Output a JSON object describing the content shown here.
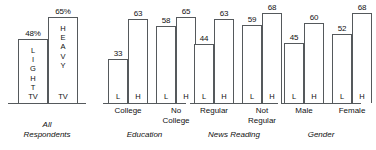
{
  "chart_data": {
    "type": "bar",
    "title": "",
    "xlabel": "",
    "ylabel": "",
    "ylim": [
      0,
      75
    ],
    "grid": false,
    "legend": "none",
    "series_names": [
      "Light TV",
      "Heavy TV"
    ],
    "panels": [
      {
        "title": "All\nRespondents",
        "groups": [
          {
            "label": "",
            "bars": [
              {
                "key": "L",
                "value": 48,
                "value_label": "48%",
                "stacked_letters": "L\nI\nG\nH\nT",
                "footer": "TV"
              },
              {
                "key": "H",
                "value": 65,
                "value_label": "65%",
                "stacked_letters": "H\nE\nA\nV\nY",
                "footer": "TV"
              }
            ]
          }
        ]
      },
      {
        "title": "Education",
        "groups": [
          {
            "label": "College",
            "bars": [
              {
                "key": "L",
                "value": 33,
                "value_label": "33",
                "inner": "L"
              },
              {
                "key": "H",
                "value": 63,
                "value_label": "63",
                "inner": "H"
              }
            ]
          },
          {
            "label": "No\nCollege",
            "bars": [
              {
                "key": "L",
                "value": 58,
                "value_label": "58",
                "inner": "L"
              },
              {
                "key": "H",
                "value": 65,
                "value_label": "65",
                "inner": "H"
              }
            ]
          }
        ]
      },
      {
        "title": "News Reading",
        "groups": [
          {
            "label": "Regular",
            "bars": [
              {
                "key": "L",
                "value": 44,
                "value_label": "44",
                "inner": "L"
              },
              {
                "key": "H",
                "value": 63,
                "value_label": "63",
                "inner": "H"
              }
            ]
          },
          {
            "label": "Not\nRegular",
            "bars": [
              {
                "key": "L",
                "value": 59,
                "value_label": "59",
                "inner": "L"
              },
              {
                "key": "H",
                "value": 68,
                "value_label": "68",
                "inner": "H"
              }
            ]
          }
        ]
      },
      {
        "title": "Gender",
        "groups": [
          {
            "label": "Male",
            "bars": [
              {
                "key": "L",
                "value": 45,
                "value_label": "45",
                "inner": "L"
              },
              {
                "key": "H",
                "value": 60,
                "value_label": "60",
                "inner": "H"
              }
            ]
          },
          {
            "label": "Female",
            "bars": [
              {
                "key": "L",
                "value": 52,
                "value_label": "52",
                "inner": "L"
              },
              {
                "key": "H",
                "value": 68,
                "value_label": "68",
                "inner": "H"
              }
            ]
          }
        ]
      }
    ]
  },
  "style": {
    "stroke": "#55595c",
    "text": "#111111",
    "background": "#ffffff"
  }
}
